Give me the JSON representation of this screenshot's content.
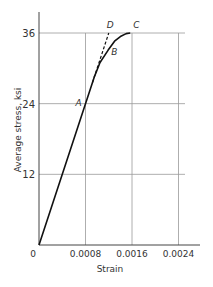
{
  "chart_data": {
    "type": "line",
    "title": "",
    "xlabel": "Strain",
    "ylabel": "Average stress, ksi",
    "xlim": [
      0,
      0.0028
    ],
    "ylim": [
      0,
      40
    ],
    "x_ticks": [
      0,
      0.0008,
      0.0016,
      0.0024
    ],
    "x_tick_labels": [
      "0",
      "0.0008",
      "0.0016",
      "0.0024"
    ],
    "y_ticks": [
      12,
      24,
      36
    ],
    "y_tick_labels": [
      "12",
      "24",
      "36"
    ],
    "grid": true,
    "legend": null,
    "series": [
      {
        "name": "stress-strain curve",
        "style": "solid",
        "x": [
          0,
          0.0008,
          0.00095,
          0.00105,
          0.00119,
          0.0013,
          0.0014,
          0.0015,
          0.00157
        ],
        "y": [
          0,
          24,
          28.5,
          31,
          33.1,
          34.6,
          35.4,
          35.9,
          36
        ]
      },
      {
        "name": "linear extension",
        "style": "dashed",
        "x": [
          0.00092,
          0.0012
        ],
        "y": [
          27.6,
          36
        ]
      }
    ],
    "annotations": [
      {
        "label": "A",
        "x": 0.0008,
        "y": 24
      },
      {
        "label": "B",
        "x": 0.00119,
        "y": 33.1
      },
      {
        "label": "C",
        "x": 0.00157,
        "y": 36
      },
      {
        "label": "D",
        "x": 0.0012,
        "y": 36
      }
    ]
  }
}
